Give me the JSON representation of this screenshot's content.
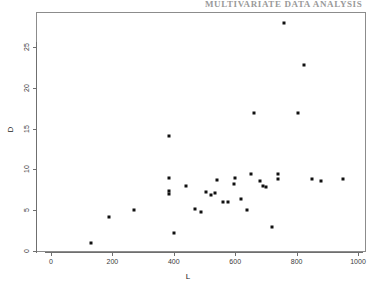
{
  "page_header": {
    "text": "MULTIVARIATE DATA ANALYSIS",
    "visible": "partially-cropped-top-edge"
  },
  "chart_data": {
    "type": "scatter",
    "title": "",
    "xlabel": "L",
    "ylabel": "D",
    "xlim": [
      -40,
      1060
    ],
    "ylim": [
      -1,
      29
    ],
    "xticks": [
      0,
      200,
      400,
      600,
      800,
      1000
    ],
    "yticks": [
      0,
      5,
      10,
      15,
      20,
      25
    ],
    "grid": false,
    "legend": "none",
    "marker": "filled-square",
    "marker_color": "#111111",
    "frame": "box",
    "points": [
      {
        "L": 130,
        "D": 1.0
      },
      {
        "L": 190,
        "D": 4.2
      },
      {
        "L": 270,
        "D": 5.0
      },
      {
        "L": 385,
        "D": 14.1
      },
      {
        "L": 385,
        "D": 9.0
      },
      {
        "L": 383,
        "D": 7.4
      },
      {
        "L": 383,
        "D": 7.0
      },
      {
        "L": 400,
        "D": 2.2
      },
      {
        "L": 440,
        "D": 8.0
      },
      {
        "L": 470,
        "D": 5.2
      },
      {
        "L": 490,
        "D": 4.8
      },
      {
        "L": 505,
        "D": 7.2
      },
      {
        "L": 520,
        "D": 6.9
      },
      {
        "L": 535,
        "D": 7.1
      },
      {
        "L": 540,
        "D": 8.7
      },
      {
        "L": 560,
        "D": 6.0
      },
      {
        "L": 575,
        "D": 6.0
      },
      {
        "L": 595,
        "D": 8.2
      },
      {
        "L": 600,
        "D": 9.0
      },
      {
        "L": 620,
        "D": 6.4
      },
      {
        "L": 640,
        "D": 5.0
      },
      {
        "L": 650,
        "D": 9.4
      },
      {
        "L": 660,
        "D": 16.9
      },
      {
        "L": 680,
        "D": 8.6
      },
      {
        "L": 690,
        "D": 8.0
      },
      {
        "L": 700,
        "D": 7.8
      },
      {
        "L": 720,
        "D": 3.0
      },
      {
        "L": 740,
        "D": 8.8
      },
      {
        "L": 740,
        "D": 9.4
      },
      {
        "L": 760,
        "D": 27.9
      },
      {
        "L": 805,
        "D": 16.9
      },
      {
        "L": 825,
        "D": 22.8
      },
      {
        "L": 850,
        "D": 8.8
      },
      {
        "L": 880,
        "D": 8.6
      },
      {
        "L": 950,
        "D": 8.8
      }
    ]
  }
}
